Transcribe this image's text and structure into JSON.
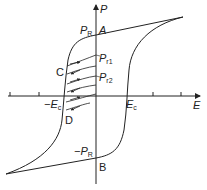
{
  "diagram": {
    "axes": {
      "x_label": "E",
      "y_label": "P"
    },
    "labels": {
      "pr_main": "P",
      "pr_main_sub": "R",
      "point_a": "A",
      "pr1": "P",
      "pr1_sub": "r1",
      "pr2": "P",
      "pr2_sub": "r2",
      "point_c": "C",
      "neg_ec": "−E",
      "neg_ec_sub": "c",
      "ec": "E",
      "ec_sub": "c",
      "point_d": "D",
      "neg_pr": "−P",
      "neg_pr_sub": "R",
      "point_b": "B"
    },
    "colors": {
      "line": "#222222",
      "background": "#ffffff"
    }
  }
}
